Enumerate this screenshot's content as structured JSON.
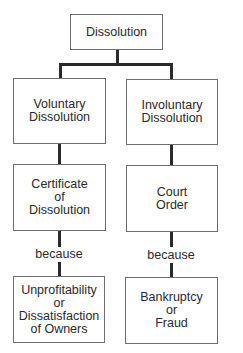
{
  "diagram": {
    "root": {
      "lines": [
        "Dissolution"
      ]
    },
    "branches": [
      {
        "type": {
          "lines": [
            "Voluntary",
            "Dissolution"
          ]
        },
        "mechanism": {
          "lines": [
            "Certificate",
            "of",
            "Dissolution"
          ]
        },
        "connector_label": "because",
        "reason": {
          "lines": [
            "Unprofitability",
            "or",
            "Dissatisfaction",
            "of Owners"
          ]
        }
      },
      {
        "type": {
          "lines": [
            "Involuntary",
            "Dissolution"
          ]
        },
        "mechanism": {
          "lines": [
            "Court",
            "Order"
          ]
        },
        "connector_label": "because",
        "reason": {
          "lines": [
            "Bankruptcy",
            "or",
            "Fraud"
          ]
        }
      }
    ]
  },
  "colors": {
    "line": "#2a2a2a",
    "box_border": "#6e6e6e",
    "text": "#2a2a2a",
    "background": "#ffffff"
  }
}
